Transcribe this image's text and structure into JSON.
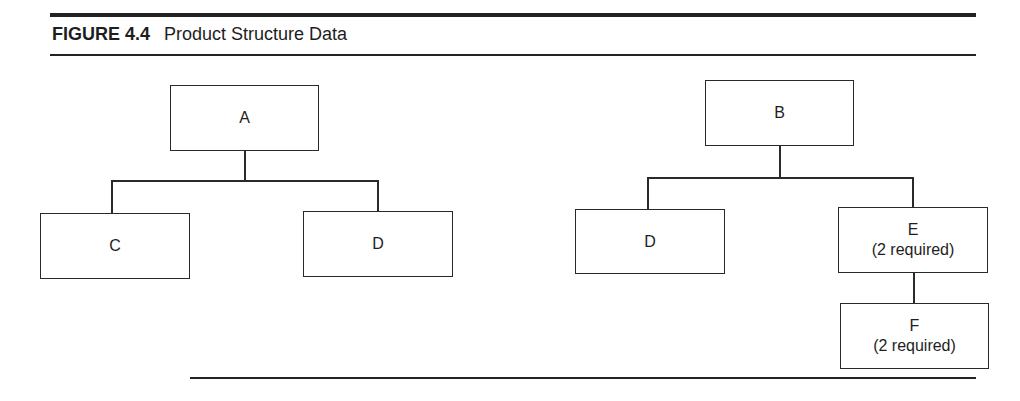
{
  "figure": {
    "number": "FIGURE 4.4",
    "title": "Product Structure Data"
  },
  "trees": [
    {
      "root": {
        "label": "A",
        "qty": ""
      },
      "children": [
        {
          "label": "C",
          "qty": ""
        },
        {
          "label": "D",
          "qty": ""
        }
      ]
    },
    {
      "root": {
        "label": "B",
        "qty": ""
      },
      "children": [
        {
          "label": "D",
          "qty": ""
        },
        {
          "label": "E",
          "qty": "(2 required)",
          "children": [
            {
              "label": "F",
              "qty": "(2 required)"
            }
          ]
        }
      ]
    }
  ]
}
